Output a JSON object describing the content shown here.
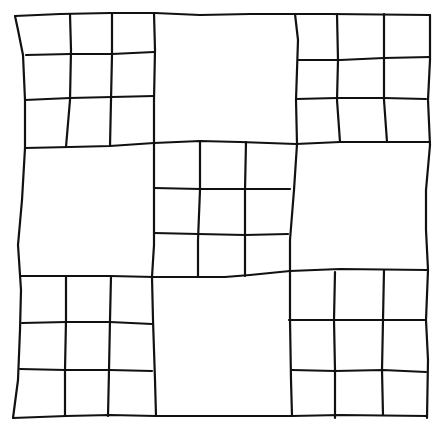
{
  "figure": {
    "description": "Hand-drawn nine-patch quilt-style grid: 3x3 large squares alternating between 3x3 subdivided squares (corners and center) and plain squares",
    "stroke_color": "#111111",
    "background": "#ffffff",
    "layout": [
      [
        "subdivided",
        "plain",
        "subdivided"
      ],
      [
        "plain",
        "subdivided",
        "plain"
      ],
      [
        "subdivided",
        "plain",
        "subdivided"
      ]
    ]
  },
  "lines": [
    {
      "id": "outer-top",
      "d": "M15,16 L60,14 L110,13 L155,13 L200,15 L250,14 L300,14 L330,14 L430,15"
    },
    {
      "id": "outer-left",
      "d": "M15,16 L18,30 L23,55 L25,100 L25,148 L22,200 L18,245 L21,290 L20,330 L18,380 L13,418"
    },
    {
      "id": "outer-right",
      "d": "M430,15 L430,60 L428,100 L430,145 L426,190 L426,230 L428,270 L426,320 L428,360 L427,418"
    },
    {
      "id": "outer-bottom",
      "d": "M13,418 L66,416 L110,415 L156,416 L200,416 L240,416 L292,416 L340,415 L427,416"
    },
    {
      "id": "h-row1",
      "d": "M25,148 L70,147 L110,146 L154,143 L200,141 L240,142 L296,144 L340,142 L378,142 L430,142"
    },
    {
      "id": "h-row2",
      "d": "M21,276 L66,276 L110,276 L154,277 L200,277 L225,277 L250,275 L290,271 L340,269 L427,270"
    },
    {
      "id": "v-col1",
      "d": "M154,13 L155,50 L154,100 L154,143 L154,200 L154,245 L152,277 L153,320 L155,380 L156,416"
    },
    {
      "id": "v-col2",
      "d": "M295,14 L298,40 L296,100 L297,144 L294,190 L290,240 L290,271 L290,320 L291,380 L292,416"
    },
    {
      "id": "tl-v1",
      "d": "M70,14 L71,50 L70,100 L66,147"
    },
    {
      "id": "tl-v2",
      "d": "M112,13 L112,55 L111,100 L110,146"
    },
    {
      "id": "tl-h1",
      "d": "M26,55 L70,54 L112,54 L154,52"
    },
    {
      "id": "tl-h2",
      "d": "M25,100 L70,98 L112,97 L154,96"
    },
    {
      "id": "tr-v1",
      "d": "M337,14 L338,60 L337,100 L340,142"
    },
    {
      "id": "tr-v2",
      "d": "M384,14 L384,60 L384,100 L387,142"
    },
    {
      "id": "tr-h1",
      "d": "M298,60 L340,60 L384,58 L430,57"
    },
    {
      "id": "tr-h2",
      "d": "M296,99 L337,98 L384,98 L426,99"
    },
    {
      "id": "c-v1",
      "d": "M200,141 L200,190 L198,240 L198,277"
    },
    {
      "id": "c-v2",
      "d": "M246,142 L245,190 L245,234 L245,276"
    },
    {
      "id": "c-h1",
      "d": "M154,188 L200,189 L245,189 L290,189"
    },
    {
      "id": "c-h2",
      "d": "M154,233 L198,234 L245,235 L288,234"
    },
    {
      "id": "bl-v1",
      "d": "M66,276 L66,320 L65,370 L65,416"
    },
    {
      "id": "bl-v2",
      "d": "M111,276 L110,320 L109,370 L108,416"
    },
    {
      "id": "bl-h1",
      "d": "M22,323 L66,322 L110,322 L152,324"
    },
    {
      "id": "bl-h2",
      "d": "M20,369 L65,370 L110,370 L152,371"
    },
    {
      "id": "br-v1",
      "d": "M335,272 L334,320 L335,370 L335,418"
    },
    {
      "id": "br-v2",
      "d": "M384,270 L383,320 L382,370 L383,415"
    },
    {
      "id": "br-h1",
      "d": "M289,320 L335,320 L383,320 L426,320"
    },
    {
      "id": "br-h2",
      "d": "M292,370 L335,371 L383,370 L426,372"
    }
  ]
}
